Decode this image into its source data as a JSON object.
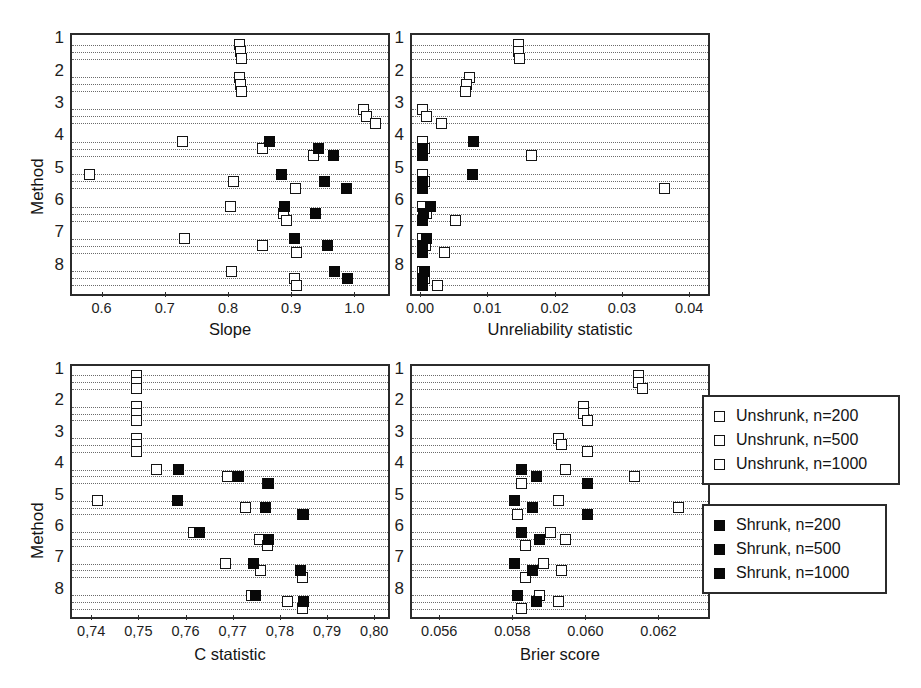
{
  "figure": {
    "ylabel": "Method",
    "methods": [
      1,
      2,
      3,
      4,
      5,
      6,
      7,
      8
    ],
    "series_order": [
      "Unshrunk, n=200",
      "Unshrunk, n=500",
      "Unshrunk, n=1000",
      "Shrunk, n=200",
      "Shrunk, n=500",
      "Shrunk, n=1000"
    ],
    "marker_colors": {
      "open_edge": "#141414",
      "open_fill": "#ffffff",
      "filled": "#080808"
    }
  },
  "legend": {
    "unshrunk_group": [
      {
        "marker": "open-square-icon",
        "label": "Unshrunk, n=200"
      },
      {
        "marker": "open-square-icon",
        "label": "Unshrunk, n=500"
      },
      {
        "marker": "open-square-icon",
        "label": "Unshrunk, n=1000"
      }
    ],
    "shrunk_group": [
      {
        "marker": "filled-square-icon",
        "label": "Shrunk, n=200"
      },
      {
        "marker": "filled-square-icon",
        "label": "Shrunk, n=500"
      },
      {
        "marker": "filled-square-icon",
        "label": "Shrunk, n=1000"
      }
    ]
  },
  "chart_data": [
    {
      "id": "slope",
      "type": "scatter",
      "title": "",
      "xlabel": "Slope",
      "ylabel": "Method",
      "xlim": [
        0.55,
        1.05
      ],
      "xticks": [
        0.6,
        0.7,
        0.8,
        0.9,
        1.0
      ],
      "xticklabels": [
        "0.6",
        "0.7",
        "0.8",
        "0.9",
        "1.0"
      ],
      "ycategories": [
        1,
        2,
        3,
        4,
        5,
        6,
        7,
        8
      ],
      "grid": true,
      "legend_position": "outside-right",
      "series": [
        {
          "name": "Unshrunk, n=200",
          "marker": "open",
          "values": [
            0.815,
            0.815,
            1.012,
            0.725,
            0.578,
            0.8,
            0.728,
            0.803
          ]
        },
        {
          "name": "Unshrunk, n=500",
          "marker": "open",
          "values": [
            0.817,
            0.817,
            1.016,
            0.851,
            0.806,
            0.884,
            0.851,
            0.902
          ]
        },
        {
          "name": "Unshrunk, n=1000",
          "marker": "open",
          "values": [
            0.818,
            0.818,
            1.03,
            0.932,
            0.903,
            0.889,
            0.905,
            0.906
          ]
        },
        {
          "name": "Shrunk, n=200",
          "marker": "filled",
          "values": [
            null,
            null,
            null,
            0.862,
            0.882,
            0.886,
            0.902,
            0.966
          ]
        },
        {
          "name": "Shrunk, n=500",
          "marker": "filled",
          "values": [
            null,
            null,
            null,
            0.94,
            0.95,
            0.936,
            0.955,
            0.986
          ]
        },
        {
          "name": "Shrunk, n=1000",
          "marker": "filled",
          "values": [
            null,
            null,
            null,
            0.963,
            0.985,
            null,
            null,
            null
          ]
        }
      ]
    },
    {
      "id": "unreliability",
      "type": "scatter",
      "title": "",
      "xlabel": "Unreliability statistic",
      "ylabel": "Method",
      "xlim": [
        -0.0015,
        0.0425
      ],
      "xticks": [
        0.0,
        0.01,
        0.02,
        0.03,
        0.04
      ],
      "xticklabels": [
        "0.00",
        "0.01",
        "0.02",
        "0.03",
        "0.04"
      ],
      "ycategories": [
        1,
        2,
        3,
        4,
        5,
        6,
        7,
        8
      ],
      "grid": true,
      "legend_position": "outside-right",
      "series": [
        {
          "name": "Unshrunk, n=200",
          "marker": "open",
          "values": [
            0.0143,
            0.007,
            0.0,
            0.0,
            0.0,
            0.0001,
            0.0,
            0.0
          ]
        },
        {
          "name": "Unshrunk, n=500",
          "marker": "open",
          "values": [
            0.0144,
            0.0066,
            0.0006,
            0.0004,
            0.0004,
            0.0006,
            0.0005,
            0.0004
          ]
        },
        {
          "name": "Unshrunk, n=1000",
          "marker": "open",
          "values": [
            0.0145,
            0.0064,
            0.0029,
            0.0163,
            0.036,
            0.005,
            0.0033,
            0.0023
          ]
        },
        {
          "name": "Shrunk, n=200",
          "marker": "filled",
          "values": [
            null,
            null,
            null,
            0.0077,
            0.0075,
            0.0012,
            0.0007,
            0.0004
          ]
        },
        {
          "name": "Shrunk, n=500",
          "marker": "filled",
          "values": [
            null,
            null,
            null,
            0.0001,
            0.0001,
            0.0002,
            0.0001,
            0.0001
          ]
        },
        {
          "name": "Shrunk, n=1000",
          "marker": "filled",
          "values": [
            null,
            null,
            null,
            0.0,
            0.0,
            0.0,
            0.0,
            0.0
          ]
        }
      ]
    },
    {
      "id": "c_statistic",
      "type": "scatter",
      "title": "",
      "xlabel": "C statistic",
      "ylabel": "Method",
      "xlim": [
        0.7355,
        0.8025
      ],
      "xticks": [
        0.74,
        0.75,
        0.76,
        0.77,
        0.78,
        0.79,
        0.8
      ],
      "xticklabels": [
        "0,74",
        "0,75",
        "0,76",
        "0,77",
        "0,78",
        "0,79",
        "0,80"
      ],
      "ycategories": [
        1,
        2,
        3,
        4,
        5,
        6,
        7,
        8
      ],
      "grid": true,
      "legend_position": "outside-right",
      "series": [
        {
          "name": "Unshrunk, n=200",
          "marker": "open",
          "values": [
            0.7492,
            0.7492,
            0.7492,
            0.7535,
            0.7408,
            0.7613,
            0.768,
            0.7735
          ]
        },
        {
          "name": "Unshrunk, n=500",
          "marker": "open",
          "values": [
            0.7492,
            0.7492,
            0.7492,
            0.7685,
            0.7723,
            0.7752,
            0.7754,
            0.7812
          ]
        },
        {
          "name": "Unshrunk, n=1000",
          "marker": "open",
          "values": [
            0.7492,
            0.7492,
            0.7492,
            0.777,
            0.7843,
            0.777,
            0.7843,
            0.7844
          ]
        },
        {
          "name": "Shrunk, n=200",
          "marker": "filled",
          "values": [
            null,
            null,
            null,
            0.758,
            0.7578,
            0.7625,
            0.774,
            0.7745
          ]
        },
        {
          "name": "Shrunk, n=500",
          "marker": "filled",
          "values": [
            null,
            null,
            null,
            0.7707,
            0.7765,
            0.7772,
            0.784,
            0.7845
          ]
        },
        {
          "name": "Shrunk, n=1000",
          "marker": "filled",
          "values": [
            null,
            null,
            null,
            0.7772,
            0.7845,
            null,
            null,
            null
          ]
        }
      ]
    },
    {
      "id": "brier_score",
      "type": "scatter",
      "title": "",
      "xlabel": "Brier score",
      "ylabel": "Method",
      "xlim": [
        0.0552,
        0.0633
      ],
      "xticks": [
        0.056,
        0.058,
        0.06,
        0.062
      ],
      "xticklabels": [
        "0.056",
        "0.058",
        "0.060",
        "0.062"
      ],
      "ycategories": [
        1,
        2,
        3,
        4,
        5,
        6,
        7,
        8
      ],
      "grid": true,
      "legend_position": "outside-right",
      "series": [
        {
          "name": "Unshrunk, n=200",
          "marker": "open",
          "values": [
            0.0614,
            0.0599,
            0.0592,
            0.0594,
            0.0592,
            0.059,
            0.0588,
            0.0587
          ]
        },
        {
          "name": "Unshrunk, n=500",
          "marker": "open",
          "values": [
            0.0614,
            0.0599,
            0.0593,
            0.0613,
            0.0625,
            0.0594,
            0.0593,
            0.0592
          ]
        },
        {
          "name": "Unshrunk, n=1000",
          "marker": "open",
          "values": [
            0.0615,
            0.06,
            0.06,
            0.0582,
            0.0581,
            0.0583,
            0.0583,
            0.0582
          ]
        },
        {
          "name": "Shrunk, n=200",
          "marker": "filled",
          "values": [
            null,
            null,
            null,
            0.0582,
            0.058,
            0.0582,
            0.058,
            0.0581
          ]
        },
        {
          "name": "Shrunk, n=500",
          "marker": "filled",
          "values": [
            null,
            null,
            null,
            0.0586,
            0.0585,
            0.0587,
            0.0585,
            0.0586
          ]
        },
        {
          "name": "Shrunk, n=1000",
          "marker": "filled",
          "values": [
            null,
            null,
            null,
            0.06,
            0.06,
            null,
            null,
            null
          ]
        }
      ]
    }
  ]
}
